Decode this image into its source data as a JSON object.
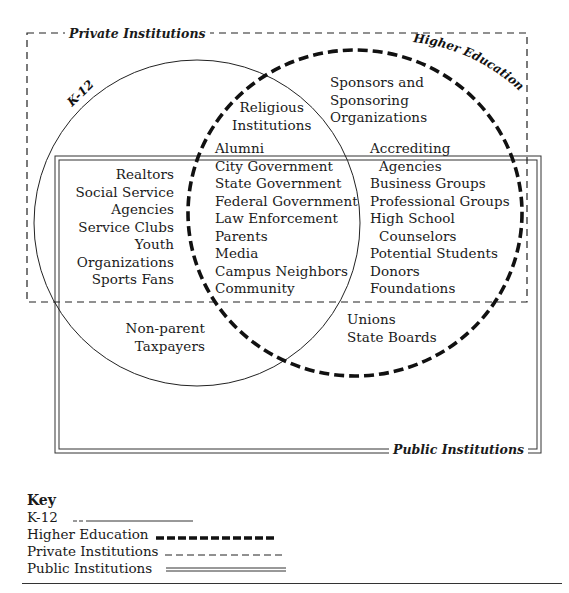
{
  "regions": {
    "private": {
      "label": "Private Institutions",
      "style": "thin-dashed"
    },
    "public": {
      "label": "Public Institutions",
      "style": "double-line"
    },
    "k12": {
      "label": "K-12",
      "style": "thin-solid"
    },
    "higher_ed": {
      "label": "Higher Education",
      "style": "heavy-dashed"
    }
  },
  "groups": {
    "religious": [
      "Religious",
      "Institutions"
    ],
    "sponsors": [
      "Sponsors and",
      "Sponsoring",
      "Organizations"
    ],
    "k12_only": [
      "Realtors",
      "Social Service",
      "Agencies",
      "Service Clubs",
      "Youth",
      "Organizations",
      "Sports Fans"
    ],
    "overlap": [
      "Alumni",
      "City Government",
      "State Government",
      "Federal Government",
      "Law Enforcement",
      "Parents",
      "Media",
      "Campus Neighbors",
      "Community"
    ],
    "higher_ed_only": [
      "Accrediting",
      "Agencies",
      "Business Groups",
      "Professional Groups",
      "High School",
      "Counselors",
      "Potential Students",
      "Donors",
      "Foundations"
    ],
    "public_k12": [
      "Non-parent",
      "Taxpayers"
    ],
    "public_higher_ed": [
      "Unions",
      "State Boards"
    ]
  },
  "key": {
    "title": "Key",
    "items": [
      {
        "label": "K-12",
        "line": "thin-solid"
      },
      {
        "label": "Higher Education",
        "line": "heavy-dashed"
      },
      {
        "label": "Private Institutions",
        "line": "thin-dashed"
      },
      {
        "label": "Public Institutions",
        "line": "double-line"
      }
    ]
  }
}
